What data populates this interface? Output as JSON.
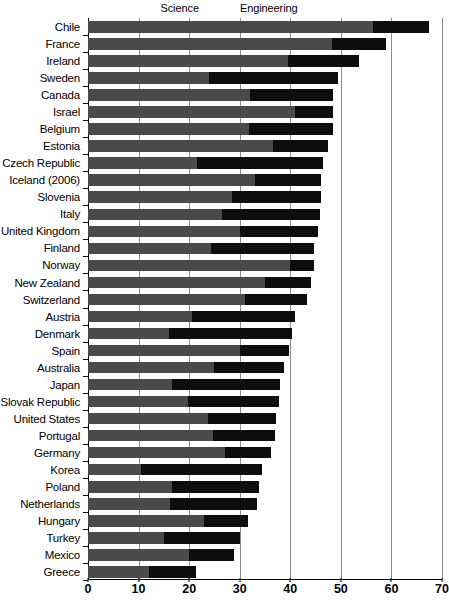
{
  "chart_data": {
    "type": "bar",
    "orientation": "horizontal",
    "stacked": true,
    "title": "",
    "subtitle": "",
    "xlabel": "",
    "ylabel": "",
    "xlim": [
      0,
      70
    ],
    "xticks": [
      0,
      10,
      20,
      30,
      40,
      50,
      60,
      70
    ],
    "grid": true,
    "legend_position": "top-center",
    "legend": [
      {
        "name": "Science",
        "color": "#4a4a4a",
        "swatch_icon": "square-swatch-icon"
      },
      {
        "name": "Engineering",
        "color": "#0d0d0d",
        "swatch_icon": "square-swatch-icon"
      }
    ],
    "categories": [
      "Chile",
      "France",
      "Ireland",
      "Sweden",
      "Canada",
      "Israel",
      "Belgium",
      "Estonia",
      "Czech Republic",
      "Iceland (2006)",
      "Slovenia",
      "Italy",
      "United Kingdom",
      "Finland",
      "Norway",
      "New Zealand",
      "Switzerland",
      "Austria",
      "Denmark",
      "Spain",
      "Australia",
      "Japan",
      "Slovak Republic",
      "United States",
      "Portugal",
      "Germany",
      "Korea",
      "Poland",
      "Netherlands",
      "Hungary",
      "Turkey",
      "Mexico",
      "Greece"
    ],
    "series": [
      {
        "name": "Science",
        "values": [
          56.3,
          48.2,
          39.5,
          24.0,
          32.0,
          41.0,
          31.8,
          36.5,
          21.5,
          33.0,
          28.5,
          26.5,
          30.0,
          24.3,
          40.0,
          35.0,
          31.0,
          20.5,
          16.0,
          30.0,
          25.0,
          16.6,
          19.8,
          23.7,
          24.7,
          27.0,
          10.5,
          16.6,
          16.2,
          23.0,
          15.0,
          20.0,
          12.0
        ]
      },
      {
        "name": "Engineering",
        "values": [
          11.1,
          10.7,
          14.0,
          25.4,
          16.4,
          7.4,
          16.6,
          11.0,
          25.0,
          13.0,
          17.5,
          19.3,
          15.4,
          20.4,
          4.7,
          9.0,
          12.3,
          20.5,
          24.4,
          9.7,
          13.7,
          21.4,
          17.9,
          13.5,
          12.3,
          9.2,
          23.9,
          17.2,
          17.2,
          8.6,
          15.0,
          8.8,
          9.3
        ]
      }
    ],
    "totals": [
      67.4,
      58.9,
      53.5,
      49.4,
      48.4,
      48.4,
      48.4,
      47.5,
      46.5,
      46.0,
      46.0,
      45.8,
      45.4,
      44.7,
      44.7,
      44.0,
      43.3,
      41.0,
      40.4,
      39.7,
      38.7,
      38.0,
      37.7,
      37.2,
      37.0,
      36.2,
      34.4,
      33.8,
      33.4,
      31.6,
      30.0,
      28.8,
      21.3
    ]
  }
}
